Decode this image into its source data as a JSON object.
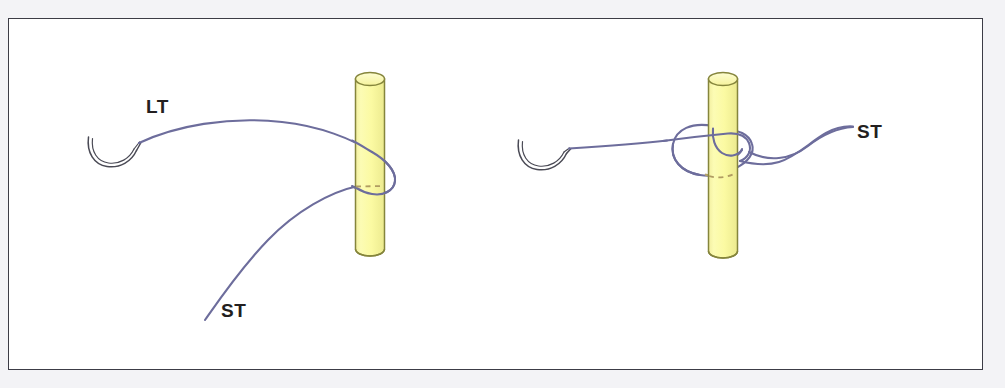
{
  "figure": {
    "kind": "surgical-suture-knot-diagram",
    "background_color": "#f3f3f6",
    "panel_background_color": "#ffffff",
    "panel_border_color": "#3c3c46",
    "thread_color": "#6d6d9c",
    "needle_color": "#4a4a55",
    "rod_fill_color": "#fbfaa3",
    "rod_stroke_color": "#85853c",
    "label_color": "#231f20"
  },
  "panels": [
    {
      "id": "left-panel",
      "name": "thread-wrapped-around-rod",
      "labels": [
        {
          "id": "lt",
          "text": "LT",
          "meaning": "long-tail"
        },
        {
          "id": "st",
          "text": "ST",
          "meaning": "short-tail"
        }
      ],
      "elements": [
        "curved-needle",
        "long-tail-thread",
        "short-tail-thread",
        "yellow-rod",
        "hidden-thread-dashed-segment"
      ]
    },
    {
      "id": "right-panel",
      "name": "completed-knot-around-rod",
      "labels": [
        {
          "id": "st",
          "text": "ST",
          "meaning": "short-tail"
        }
      ],
      "elements": [
        "curved-needle",
        "knot-loop",
        "short-tail-thread",
        "yellow-rod",
        "hidden-thread-dashed-segment"
      ]
    }
  ],
  "labels": {
    "lt": "LT",
    "st_left": "ST",
    "st_right": "ST"
  }
}
